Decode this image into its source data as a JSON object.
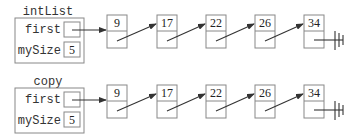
{
  "lists": [
    {
      "name": "intList",
      "fields": {
        "first_label": "first",
        "size_label": "mySize",
        "size_value": "5"
      },
      "nodes": [
        "9",
        "17",
        "22",
        "26",
        "34"
      ]
    },
    {
      "name": "copy",
      "fields": {
        "first_label": "first",
        "size_label": "mySize",
        "size_value": "5"
      },
      "nodes": [
        "9",
        "17",
        "22",
        "26",
        "34"
      ]
    }
  ],
  "null_symbol": "ground-null-icon"
}
